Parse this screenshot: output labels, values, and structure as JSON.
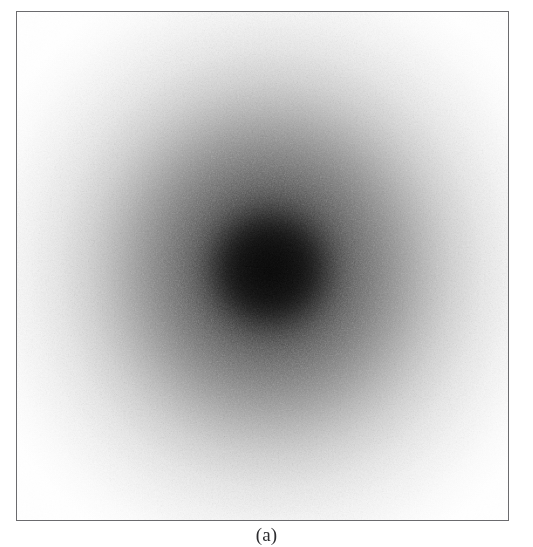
{
  "figure": {
    "caption": "(a)",
    "panel": {
      "border_color": "#6b6b6e",
      "background_color": "#ffffff",
      "left": 16,
      "top": 11,
      "width": 493,
      "height": 510
    }
  },
  "chart_data": {
    "type": "heatmap",
    "title": "",
    "subtitle": "",
    "xlabel": "",
    "ylabel": "",
    "colormap": "grayscale",
    "colormap_dark": "#000000",
    "colormap_light": "#ffffff",
    "grid": false,
    "legend": false,
    "axes_visible": false,
    "tick_labels_x": [],
    "tick_labels_y": [],
    "annotations": [
      "(a)"
    ],
    "center": {
      "x_frac": 0.515,
      "y_frac": 0.505
    },
    "noise": {
      "kind": "speckle",
      "amplitude_pct": 9,
      "grain_px": 1.2
    },
    "radial_profile": {
      "note": "Gray level (0 = black, 255 = white) sampled as a function of normalised radius from the centre to the panel edge.",
      "radius_frac": [
        0.0,
        0.05,
        0.1,
        0.15,
        0.2,
        0.25,
        0.3,
        0.35,
        0.4,
        0.45,
        0.5,
        0.55,
        0.6,
        0.7,
        0.8,
        0.9,
        1.0
      ],
      "gray_level": [
        8,
        12,
        22,
        38,
        58,
        80,
        100,
        120,
        140,
        160,
        180,
        198,
        214,
        236,
        248,
        253,
        255
      ]
    }
  }
}
